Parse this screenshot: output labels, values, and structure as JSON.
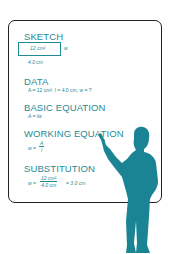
{
  "colors": {
    "accent": "#1f8a96",
    "figure": "#1a8494",
    "border": "#222222"
  },
  "board": {
    "sketch": {
      "heading": "SKETCH",
      "area_label": "12 cm²",
      "side_label": "w",
      "bottom_label": "4.0 cm"
    },
    "data": {
      "heading": "DATA",
      "text": "A = 12 cm², l = 4.0 cm, w = ?"
    },
    "basic": {
      "heading": "BASIC EQUATION",
      "text": "A = lw"
    },
    "working": {
      "heading": "WORKING EQUATION",
      "lhs": "w =",
      "num": "A",
      "den": "l"
    },
    "substitution": {
      "heading": "SUBSTITUTION",
      "lhs": "w =",
      "num": "12 cm²",
      "den": "4.0 cm",
      "result": "= 3.0 cm"
    }
  },
  "figure": {
    "icon": "teacher-silhouette-icon"
  }
}
